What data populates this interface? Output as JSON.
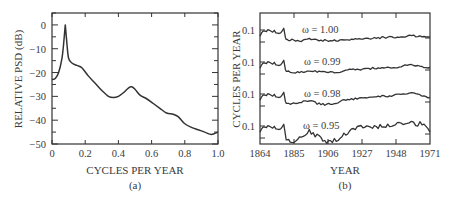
{
  "chart_data": [
    {
      "panel": "(a)",
      "type": "line",
      "title": "",
      "xlabel": "CYCLES PER YEAR",
      "ylabel": "RELATIVE PSD (dB)",
      "xlim": [
        0,
        1.0
      ],
      "ylim": [
        -50,
        5
      ],
      "xticks": [
        "0",
        "0.2",
        "0.4",
        "0.6",
        "0.8",
        "1.0"
      ],
      "yticks": [
        "0",
        "-10",
        "-20",
        "-30",
        "-40",
        "-50"
      ],
      "grid": false,
      "series": [
        {
          "name": "PSD",
          "x": [
            0,
            0.02,
            0.04,
            0.06,
            0.07,
            0.08,
            0.09,
            0.1,
            0.12,
            0.15,
            0.18,
            0.22,
            0.26,
            0.3,
            0.34,
            0.37,
            0.4,
            0.43,
            0.46,
            0.48,
            0.5,
            0.53,
            0.57,
            0.61,
            0.65,
            0.69,
            0.73,
            0.76,
            0.8,
            0.84,
            0.88,
            0.92,
            0.96,
            1.0
          ],
          "y": [
            -23,
            -22.5,
            -20,
            -14,
            -8,
            0,
            -8,
            -14,
            -16,
            -17,
            -18,
            -21.5,
            -24.5,
            -27.5,
            -30,
            -30.5,
            -30,
            -28.5,
            -26.5,
            -26,
            -27,
            -29.5,
            -31,
            -33,
            -35,
            -37,
            -37.5,
            -38.5,
            -41.5,
            -43,
            -44,
            -45,
            -46,
            -45
          ]
        }
      ]
    },
    {
      "panel": "(b)",
      "type": "line",
      "title": "",
      "xlabel": "YEAR",
      "ylabel": "CYCLES PER YEAR",
      "xlim": [
        1864,
        1971
      ],
      "xticks": [
        "1864",
        "1885",
        "1906",
        "1927",
        "1948",
        "1971"
      ],
      "yticks": [
        "0.1",
        "0.1",
        "0.1",
        "0.1"
      ],
      "grid": false,
      "series": [
        {
          "name": "ω = 1.00",
          "label_pos": [
            1880,
            0.09
          ]
        },
        {
          "name": "ω = 0.99",
          "label_pos": [
            1885,
            0.09
          ]
        },
        {
          "name": "ω = 0.98",
          "label_pos": [
            1885,
            0.09
          ]
        },
        {
          "name": "ω = 0.95",
          "label_pos": [
            1885,
            0.09
          ]
        }
      ],
      "series_profile_x": [
        1864,
        1865,
        1866,
        1868,
        1869,
        1870,
        1872,
        1873,
        1874,
        1876,
        1877,
        1878,
        1879,
        1880,
        1880.5,
        1881,
        1884,
        1890,
        1895,
        1900,
        1906,
        1912,
        1918,
        1924,
        1930,
        1936,
        1942,
        1948,
        1954,
        1958,
        1962,
        1966,
        1971
      ],
      "series_offsets": [
        [
          0.3,
          0.55,
          0.7,
          0.65,
          0.8,
          0.75,
          0.6,
          0.75,
          0.55,
          0.5,
          0.55,
          0.7,
          0.9,
          0.2,
          0.05,
          0.05,
          0.0,
          -0.05,
          0.05,
          0.0,
          -0.05,
          -0.05,
          0.0,
          0.05,
          0.1,
          0.15,
          0.2,
          0.2,
          0.25,
          0.35,
          0.3,
          0.25,
          0.25
        ],
        [
          0.3,
          0.55,
          0.7,
          0.65,
          0.8,
          0.75,
          0.6,
          0.75,
          0.55,
          0.5,
          0.55,
          0.7,
          0.9,
          0.2,
          0.05,
          0.05,
          -0.05,
          0.0,
          0.1,
          0.05,
          -0.05,
          0.0,
          0.1,
          0.2,
          0.2,
          0.3,
          0.35,
          0.35,
          0.45,
          0.55,
          0.45,
          0.4,
          0.35
        ],
        [
          0.3,
          0.55,
          0.7,
          0.65,
          0.8,
          0.75,
          0.6,
          0.75,
          0.55,
          0.5,
          0.55,
          0.7,
          0.9,
          0.2,
          0.05,
          0.05,
          0.0,
          0.15,
          0.25,
          0.05,
          -0.05,
          0.1,
          0.3,
          0.4,
          0.45,
          0.55,
          0.6,
          0.65,
          0.75,
          0.85,
          0.75,
          0.6,
          0.5
        ],
        [
          0.3,
          0.55,
          0.7,
          0.65,
          0.8,
          0.75,
          0.6,
          0.75,
          0.55,
          0.5,
          0.55,
          0.7,
          0.9,
          0.1,
          -0.3,
          -0.3,
          -0.45,
          -0.2,
          0.4,
          0.0,
          -0.4,
          -0.3,
          0.2,
          0.5,
          0.8,
          0.7,
          0.8,
          0.9,
          1.0,
          1.1,
          0.9,
          1.0,
          0.3
        ]
      ]
    }
  ],
  "figure": {
    "panel_a_caption": "(a)",
    "panel_b_caption": "(b)"
  }
}
